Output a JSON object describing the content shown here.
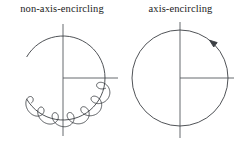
{
  "figure": {
    "background_color": "#ffffff",
    "line_color": "#3c4044",
    "axis_color": "#555a5e",
    "panels": [
      {
        "id": "non-axis-encircling",
        "title": "non-axis-encircling",
        "curve_type": "looping-arc",
        "encircles_origin": "no",
        "loop_count": 17,
        "has_arrow": false
      },
      {
        "id": "axis-encircling",
        "title": "axis-encircling",
        "curve_type": "plain-circle",
        "encircles_origin": "yes",
        "loop_count": 0,
        "has_arrow": true,
        "arrow_direction": "counterclockwise"
      }
    ]
  },
  "chart_data": {
    "type": "line",
    "title": "",
    "xlabel": "",
    "ylabel": "",
    "grid": false,
    "legend": "none",
    "subplots": [
      {
        "name": "non-axis-encircling",
        "description": "Closed contour in the complex plane drawn with many small cusped loops riding along the upper-left portion of a circle; the contour does not encircle the origin of the axes.",
        "center": [
          63,
          62
        ],
        "radius": 42,
        "loop_amplitude": 7,
        "loop_count": 17,
        "loop_arc_start_deg": 210,
        "loop_arc_end_deg": 355,
        "axes": {
          "vertical_from": [
            63,
            8
          ],
          "vertical_to": [
            63,
            120
          ],
          "horizontal_from": [
            63,
            62
          ],
          "horizontal_to": [
            118,
            62
          ]
        }
      },
      {
        "name": "axis-encircling",
        "description": "Smooth circular contour centered on the axis origin, traversed counterclockwise as indicated by the arrowhead at the upper right; the contour encircles the origin once.",
        "center": [
          56,
          62
        ],
        "radius": 48,
        "loop_amplitude": 0,
        "loop_count": 0,
        "arrow_angle_deg": 52,
        "axes": {
          "vertical_from": [
            56,
            6
          ],
          "vertical_to": [
            56,
            122
          ],
          "horizontal_from": [
            56,
            62
          ],
          "horizontal_to": [
            110,
            62
          ]
        }
      }
    ]
  }
}
